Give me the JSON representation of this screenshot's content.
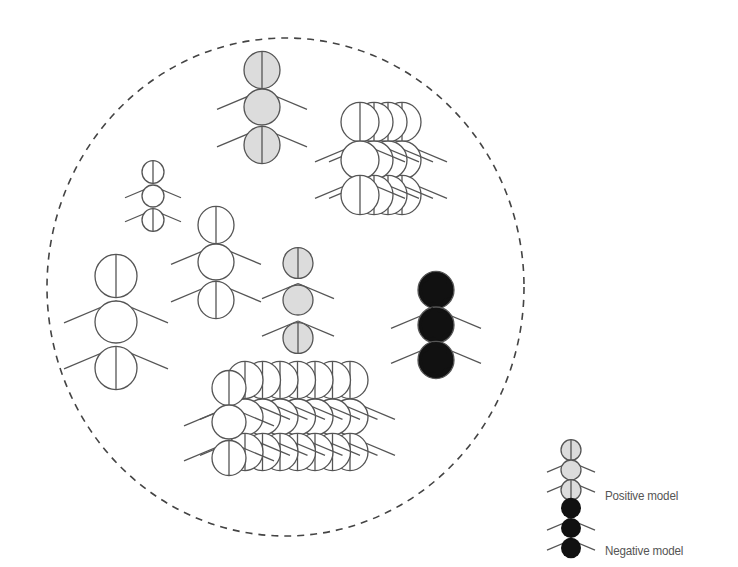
{
  "diagram": {
    "boundary": {
      "shape": "dashed-ellipse",
      "cx": 285.5,
      "cy": 287,
      "rx": 238.5,
      "ry": 249,
      "stroke": "#444444"
    },
    "colors": {
      "outline": "#555555",
      "positive_fill": "#dcdcdc",
      "neutral_fill": "#ffffff",
      "negative_fill": "#111111"
    },
    "figures": [
      {
        "id": "positive-ant-top",
        "kind": "positive",
        "x": 262,
        "ys": [
          70,
          107,
          145
        ],
        "r": 18,
        "leg": 45
      },
      {
        "id": "neutral-ant-small",
        "kind": "neutral",
        "x": 153,
        "ys": [
          172,
          196,
          220
        ],
        "r": 11,
        "leg": 28
      },
      {
        "id": "neutral-ant-medium",
        "kind": "neutral",
        "x": 216,
        "ys": [
          225,
          262,
          300
        ],
        "r": 18,
        "leg": 45
      },
      {
        "id": "neutral-ant-large",
        "kind": "neutral",
        "x": 116,
        "ys": [
          276,
          322,
          368
        ],
        "r": 21,
        "leg": 52
      },
      {
        "id": "positive-ant-small",
        "kind": "positive",
        "x": 298,
        "ys": [
          263,
          300,
          338
        ],
        "r": 15,
        "leg": 36
      },
      {
        "id": "negative-ant",
        "kind": "negative",
        "x": 436,
        "ys": [
          290,
          325,
          360
        ],
        "r": 18,
        "leg": 45
      }
    ],
    "stacks": [
      {
        "id": "neutral-stack-top-right",
        "kind": "neutral",
        "x0": 402,
        "dx": -14,
        "count": 4,
        "ys": [
          122,
          160,
          195
        ],
        "r": 19,
        "leg": 45
      },
      {
        "id": "neutral-stack-bottom",
        "kind": "neutral",
        "x0": 350,
        "dx": -17.5,
        "count": 7,
        "ys": [
          380,
          417,
          452
        ],
        "r": 18,
        "leg": 45,
        "front": {
          "x": 229,
          "ys": [
            388,
            422,
            458
          ],
          "r": 17
        }
      }
    ]
  },
  "legend": {
    "items": [
      {
        "label": "Positive model",
        "kind": "positive",
        "x": 571,
        "ys": [
          450,
          470,
          490
        ],
        "r": 10,
        "leg": 24
      },
      {
        "label": "Negative model",
        "kind": "negative",
        "x": 571,
        "ys": [
          508,
          528,
          548
        ],
        "r": 10,
        "leg": 24
      }
    ]
  }
}
